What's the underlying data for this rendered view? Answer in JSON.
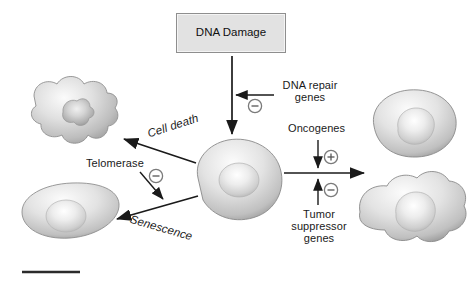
{
  "diagram": {
    "title_box": {
      "label": "DNA Damage"
    },
    "nodes": [
      {
        "id": "damage",
        "label": "DNA Damage",
        "type": "box"
      },
      {
        "id": "apoptotic-cell",
        "label": "",
        "type": "cell-apoptotic"
      },
      {
        "id": "senescent-cell",
        "label": "",
        "type": "cell-senescent"
      },
      {
        "id": "central-cell",
        "label": "",
        "type": "cell-normal"
      },
      {
        "id": "proliferating-cell-upper",
        "label": "",
        "type": "cell-normal"
      },
      {
        "id": "proliferating-cell-lower",
        "label": "",
        "type": "cell-divided"
      }
    ],
    "labels": {
      "dna_repair_genes": "DNA repair\ngenes",
      "oncogenes": "Oncogenes",
      "tumor_suppressor_genes": "Tumor\nsuppressor\ngenes",
      "cell_death": "Cell death",
      "telomerase": "Telomerase",
      "senescence": "Senescence"
    },
    "signs": {
      "dna_repair": "−",
      "oncogenes": "+",
      "tumor_suppressor": "−",
      "telomerase": "−"
    },
    "colors": {
      "box_fill": "#e2e2e2",
      "box_border": "#8e8e8e",
      "arrow": "#1a1a1a",
      "text": "#1a1a1a",
      "cell_light": "#f2f2f2",
      "cell_mid": "#c8c8c8",
      "cell_dark": "#8c8c8c",
      "sign_circle": "#7a7a7a",
      "rule": "#2b2b2b",
      "background": "#ffffff"
    },
    "footer_rule": ""
  }
}
